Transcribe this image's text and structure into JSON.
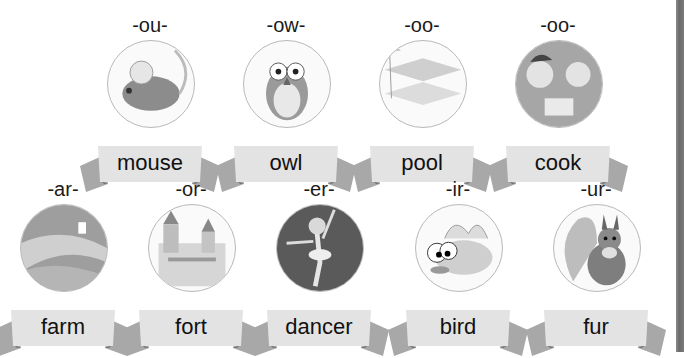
{
  "rows": [
    {
      "cards": [
        {
          "sound": "-ou-",
          "word": "mouse",
          "picture": "mouse-illustration"
        },
        {
          "sound": "-ow-",
          "word": "owl",
          "picture": "owl-illustration"
        },
        {
          "sound": "-oo-",
          "word": "pool",
          "picture": "pool-illustration"
        },
        {
          "sound": "-oo-",
          "word": "cook",
          "picture": "cooking-kids-illustration"
        }
      ]
    },
    {
      "cards": [
        {
          "sound": "-ar-",
          "word": "farm",
          "picture": "farm-illustration"
        },
        {
          "sound": "-or-",
          "word": "fort",
          "picture": "castle-illustration"
        },
        {
          "sound": "-er-",
          "word": "dancer",
          "picture": "ballerina-illustration"
        },
        {
          "sound": "-ir-",
          "word": "bird",
          "picture": "bird-illustration"
        },
        {
          "sound": "-ur-",
          "word": "fur",
          "picture": "squirrel-illustration"
        }
      ]
    }
  ]
}
